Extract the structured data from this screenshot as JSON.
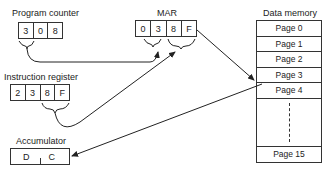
{
  "program_counter": {
    "label": "Program counter",
    "digits": [
      "3",
      "0",
      "8"
    ]
  },
  "mar": {
    "label": "MAR",
    "digits": [
      "0",
      "3",
      "8",
      "F"
    ]
  },
  "instruction_register": {
    "label": "Instruction register",
    "digits": [
      "2",
      "3",
      "8",
      "F"
    ]
  },
  "accumulator": {
    "label": "Accumulator",
    "digits": [
      "D",
      "C"
    ]
  },
  "data_memory": {
    "label": "Data memory",
    "pages": [
      "Page 0",
      "Page 1",
      "Page 2",
      "Page 3",
      "Page 4"
    ],
    "last_page": "Page 15"
  }
}
